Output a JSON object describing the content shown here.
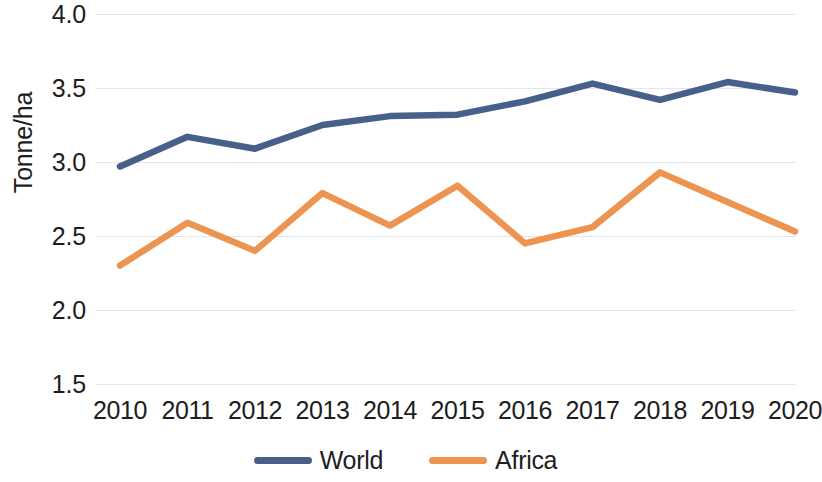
{
  "chart_data": {
    "type": "line",
    "title": "",
    "xlabel": "",
    "ylabel": "Tonne/ha",
    "categories": [
      "2010",
      "2011",
      "2012",
      "2013",
      "2014",
      "2015",
      "2016",
      "2017",
      "2018",
      "2019",
      "2020"
    ],
    "series": [
      {
        "name": "World",
        "color": "#466089",
        "values": [
          2.97,
          3.17,
          3.09,
          3.25,
          3.31,
          3.32,
          3.41,
          3.53,
          3.42,
          3.54,
          3.47
        ]
      },
      {
        "name": "Africa",
        "color": "#ED9550",
        "values": [
          2.3,
          2.59,
          2.4,
          2.79,
          2.57,
          2.84,
          2.45,
          2.56,
          2.93,
          2.73,
          2.53
        ]
      }
    ],
    "ylim": [
      1.5,
      4.0
    ],
    "y_ticks": [
      "4.0",
      "3.5",
      "3.0",
      "2.5",
      "2.0",
      "1.5"
    ],
    "y_tick_values": [
      4.0,
      3.5,
      3.0,
      2.5,
      2.0,
      1.5
    ],
    "grid": true,
    "grid_color": "#dfe1e6",
    "legend_position": "bottom",
    "legend": [
      "World",
      "Africa"
    ]
  }
}
